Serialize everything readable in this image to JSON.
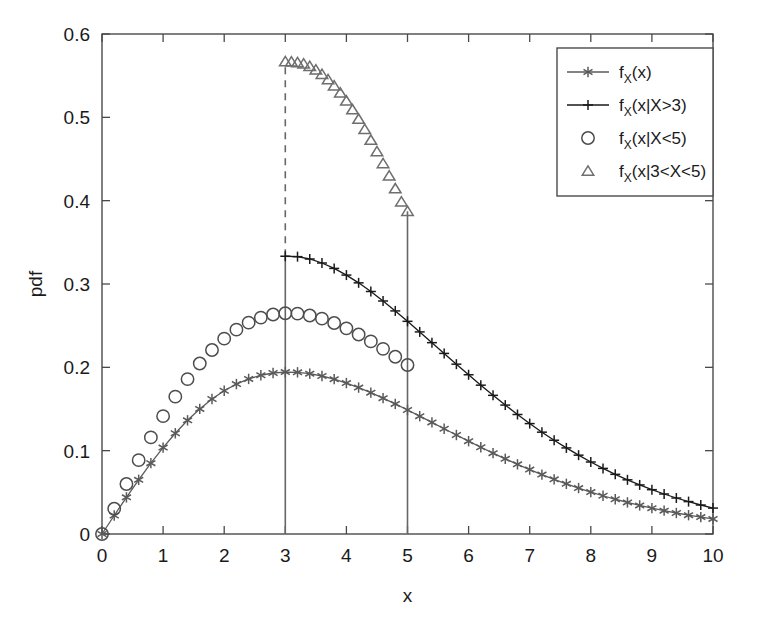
{
  "chart_data": {
    "type": "line",
    "title": "",
    "xlabel": "x",
    "ylabel": "pdf",
    "xlim": [
      0,
      10
    ],
    "ylim": [
      0,
      0.6
    ],
    "xticks": [
      "0",
      "1",
      "2",
      "3",
      "4",
      "5",
      "6",
      "7",
      "8",
      "9",
      "10"
    ],
    "yticks": [
      "0",
      "0.1",
      "0.2",
      "0.3",
      "0.4",
      "0.5",
      "0.6"
    ],
    "grid": false,
    "legend_position": "top-right",
    "distribution_note": "Rayleigh pdf sigma=3 with conditional densities",
    "annotations": [
      {
        "name": "vline-x3",
        "x": 3,
        "y0": 0,
        "y1": 0.3333,
        "style": "solid"
      },
      {
        "name": "vline-x3-dashed",
        "x": 3,
        "y0": 0.3333,
        "y1": 0.5669,
        "style": "dashed"
      },
      {
        "name": "vline-x5",
        "x": 5,
        "y0": 0,
        "y1": 0.3873,
        "style": "solid"
      }
    ],
    "series": [
      {
        "name": "f_X(x)",
        "label_main": "f",
        "label_sub": "X",
        "label_rest": "(x)",
        "marker": "asterisk",
        "color": "#5a5a5a",
        "line": true,
        "x": [
          0,
          0.2,
          0.4,
          0.6,
          0.8,
          1,
          1.2,
          1.4,
          1.6,
          1.8,
          2,
          2.2,
          2.4,
          2.6,
          2.8,
          3,
          3.2,
          3.4,
          3.6,
          3.8,
          4,
          4.2,
          4.4,
          4.6,
          4.8,
          5,
          5.2,
          5.4,
          5.6,
          5.8,
          6,
          6.2,
          6.4,
          6.6,
          6.8,
          7,
          7.2,
          7.4,
          7.6,
          7.8,
          8,
          8.2,
          8.4,
          8.6,
          8.8,
          9,
          9.2,
          9.4,
          9.6,
          9.8,
          10
        ],
        "y": [
          0,
          0.0222,
          0.044,
          0.065,
          0.085,
          0.1037,
          0.1209,
          0.1364,
          0.1501,
          0.162,
          0.1719,
          0.1799,
          0.1861,
          0.1905,
          0.1932,
          0.1943,
          0.194,
          0.1924,
          0.1896,
          0.1858,
          0.1811,
          0.1757,
          0.1696,
          0.163,
          0.1561,
          0.1488,
          0.1414,
          0.1339,
          0.1263,
          0.1188,
          0.1114,
          0.1041,
          0.097,
          0.0902,
          0.0836,
          0.0773,
          0.0713,
          0.0656,
          0.0602,
          0.0551,
          0.0503,
          0.0459,
          0.0417,
          0.0379,
          0.0343,
          0.031,
          0.028,
          0.0252,
          0.0226,
          0.0203,
          0.0181
        ]
      },
      {
        "name": "f_X(x|X>3)",
        "label_main": "f",
        "label_sub": "X",
        "label_rest": "(x|X>3)",
        "marker": "plus",
        "color": "#1a1a1a",
        "line": true,
        "x": [
          3,
          3.2,
          3.4,
          3.6,
          3.8,
          4,
          4.2,
          4.4,
          4.6,
          4.8,
          5,
          5.2,
          5.4,
          5.6,
          5.8,
          6,
          6.2,
          6.4,
          6.6,
          6.8,
          7,
          7.2,
          7.4,
          7.6,
          7.8,
          8,
          8.2,
          8.4,
          8.6,
          8.8,
          9,
          9.2,
          9.4,
          9.6,
          9.8,
          10
        ],
        "y": [
          0.3333,
          0.3328,
          0.33,
          0.3252,
          0.3187,
          0.3107,
          0.3014,
          0.291,
          0.2796,
          0.2677,
          0.2552,
          0.2425,
          0.2296,
          0.2167,
          0.2038,
          0.1911,
          0.1786,
          0.1664,
          0.1547,
          0.1434,
          0.1325,
          0.1222,
          0.1125,
          0.1033,
          0.0946,
          0.0864,
          0.0787,
          0.0716,
          0.065,
          0.0589,
          0.0532,
          0.048,
          0.0432,
          0.0389,
          0.0348,
          0.0311
        ]
      },
      {
        "name": "f_X(x|X<5)",
        "label_main": "f",
        "label_sub": "X",
        "label_rest": "(x|X<5)",
        "marker": "circle",
        "color": "#4d4d4d",
        "line": false,
        "x": [
          0,
          0.2,
          0.4,
          0.6,
          0.8,
          1,
          1.2,
          1.4,
          1.6,
          1.8,
          2,
          2.2,
          2.4,
          2.6,
          2.8,
          3,
          3.2,
          3.4,
          3.6,
          3.8,
          4,
          4.2,
          4.4,
          4.6,
          4.8,
          5
        ],
        "y": [
          0,
          0.0303,
          0.06,
          0.0886,
          0.1159,
          0.1414,
          0.1648,
          0.1859,
          0.2046,
          0.2208,
          0.2344,
          0.2452,
          0.2536,
          0.2597,
          0.2634,
          0.2649,
          0.2645,
          0.2622,
          0.2584,
          0.2532,
          0.2468,
          0.2394,
          0.2311,
          0.2222,
          0.2127,
          0.2028
        ]
      },
      {
        "name": "f_X(x|3<X<5)",
        "label_main": "f",
        "label_sub": "X",
        "label_rest": "(x|3<X<5)",
        "marker": "triangle",
        "color": "#6e6e6e",
        "line": false,
        "x": [
          3,
          3.1,
          3.2,
          3.3,
          3.4,
          3.5,
          3.6,
          3.7,
          3.8,
          3.9,
          4,
          4.1,
          4.2,
          4.3,
          4.4,
          4.5,
          4.6,
          4.7,
          4.8,
          4.9,
          5
        ],
        "y": [
          0.5669,
          0.5666,
          0.5657,
          0.5643,
          0.5612,
          0.557,
          0.5517,
          0.5453,
          0.5378,
          0.5293,
          0.5197,
          0.5092,
          0.4978,
          0.4856,
          0.4726,
          0.4589,
          0.4446,
          0.4298,
          0.4144,
          0.3987,
          0.3873
        ]
      }
    ]
  },
  "legend": {
    "items": [
      {
        "marker": "asterisk-with-line",
        "main": "f",
        "sub": "X",
        "rest": "(x)"
      },
      {
        "marker": "plus-with-line",
        "main": "f",
        "sub": "X",
        "rest": "(x|X>3)"
      },
      {
        "marker": "circle",
        "main": "f",
        "sub": "X",
        "rest": "(x|X<5)"
      },
      {
        "marker": "triangle",
        "main": "f",
        "sub": "X",
        "rest": "(x|3<X<5)"
      }
    ]
  },
  "colors": {
    "axis": "#4a4a4a",
    "text": "#1a1a1a",
    "series_asterisk": "#5a5a5a",
    "series_plus": "#1a1a1a",
    "series_circle": "#4d4d4d",
    "series_triangle": "#6e6e6e",
    "background": "#ffffff"
  }
}
